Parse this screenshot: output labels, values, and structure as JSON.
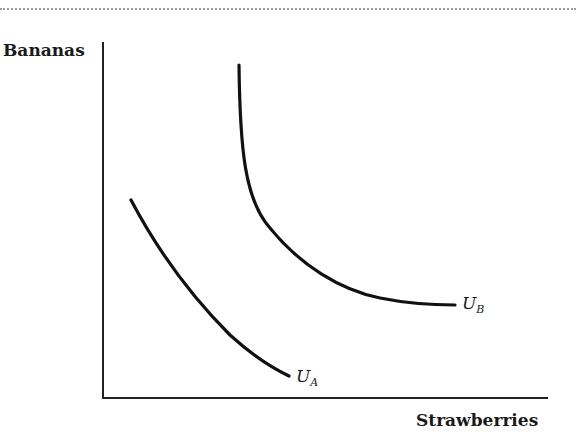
{
  "diagram": {
    "type": "indifference-curves",
    "y_axis_label": "Bananas",
    "x_axis_label": "Strawberries",
    "curves": [
      {
        "id": "UA",
        "label_main": "U",
        "label_sub": "A",
        "description": "lower indifference curve"
      },
      {
        "id": "UB",
        "label_main": "U",
        "label_sub": "B",
        "description": "higher indifference curve"
      }
    ],
    "colors": {
      "line": "#111111",
      "background": "#ffffff",
      "dotted_rule": "#9a9a9a"
    }
  }
}
